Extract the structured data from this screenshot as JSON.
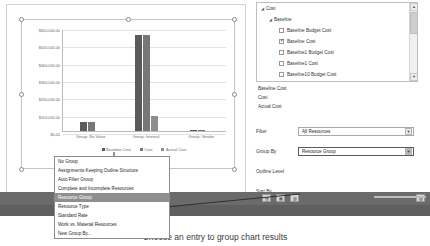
{
  "chart_data": {
    "type": "bar",
    "title": "",
    "xlabel": "",
    "ylabel": "",
    "ylim": [
      0,
      600000
    ],
    "grid": true,
    "legend_position": "bottom",
    "categories": [
      "Group: No Value",
      "Group: Internal",
      "Group: Vendor"
    ],
    "ytick_labels": [
      "$600,000.00",
      "$500,000.00",
      "$400,000.00",
      "$300,000.00",
      "$200,000.00",
      "$100,000.00",
      "$0.00"
    ],
    "ytick_values": [
      600000,
      500000,
      400000,
      300000,
      200000,
      100000,
      0
    ],
    "series": [
      {
        "name": "Baseline Cost",
        "color": "#5b5b5b",
        "values": [
          50000,
          552000,
          6000
        ]
      },
      {
        "name": "Cost",
        "color": "#777777",
        "values": [
          52000,
          552000,
          6000
        ]
      },
      {
        "name": "Actual Cost",
        "color": "#8e8e8e",
        "values": [
          0,
          88000,
          0
        ]
      }
    ]
  },
  "chart_pane": {
    "name": "chart-object-selected"
  },
  "fields": {
    "scroll": {
      "up": "▲",
      "down": "▼"
    },
    "tree": [
      {
        "level": 1,
        "expander": "◢",
        "label": "Cost",
        "checkbox": null,
        "name": "tree-node-cost"
      },
      {
        "level": 2,
        "expander": "◢",
        "label": "Baseline",
        "checkbox": null,
        "name": "tree-node-baseline"
      },
      {
        "level": 3,
        "expander": "",
        "label": "Baseline Budget Cost",
        "checkbox": false,
        "name": "tree-item-baseline-budget-cost"
      },
      {
        "level": 3,
        "expander": "",
        "label": "Baseline Cost",
        "checkbox": true,
        "name": "tree-item-baseline-cost"
      },
      {
        "level": 3,
        "expander": "",
        "label": "Baseline1 Budget Cost",
        "checkbox": false,
        "name": "tree-item-baseline1-budget-cost"
      },
      {
        "level": 3,
        "expander": "",
        "label": "Baseline1 Cost",
        "checkbox": false,
        "name": "tree-item-baseline1-cost"
      },
      {
        "level": 3,
        "expander": "",
        "label": "Baseline10 Budget Cost",
        "checkbox": false,
        "name": "tree-item-baseline10-budget-cost"
      }
    ],
    "selected": [
      "Baseline Cost",
      "Cost",
      "Actual Cost"
    ]
  },
  "options": {
    "filter": {
      "label": "Filter",
      "value": "All Resources",
      "arrow": "▼"
    },
    "group_by": {
      "label": "Group By",
      "value": "Resource Group",
      "arrow": "▼"
    },
    "outline_level": {
      "label": "Outline Level"
    },
    "sort_by": {
      "label": "Sort By"
    }
  },
  "dropdown": {
    "items": [
      "No Group",
      "Assignments Keeping Outline Structure",
      "Auto Filter Group",
      "Complete and Incomplete Resources",
      "Resource Group",
      "Resource Type",
      "Standard Rate",
      "Work vs. Material Resources",
      "New Group By..."
    ],
    "selected_index": 4
  },
  "status_bar": {
    "icons": [
      "▤",
      "▦",
      "▥",
      "▧"
    ],
    "zoom_label": ""
  },
  "caption": {
    "text": "Choose an entry to group chart results"
  },
  "colors": {
    "bar_baseline": "#5b5b5b",
    "bar_cost": "#777777",
    "bar_actual": "#8e8e8e",
    "highlight": "#8f8f8f",
    "status_bar": "#6b6b6b"
  }
}
